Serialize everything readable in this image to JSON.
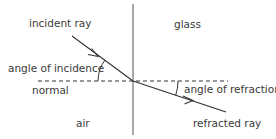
{
  "diagram": {
    "labels": {
      "incident_ray": "incident ray",
      "glass": "glass",
      "angle_of_incidence": "angle of incidence",
      "normal": "normal",
      "angle_of_refraction": "angle of refraction",
      "air": "air",
      "refracted_ray": "refracted ray"
    },
    "colors": {
      "boundary": "#a8a8a8",
      "ray": "#333333",
      "normal": "#333333",
      "text": "#3a3a3a"
    }
  }
}
